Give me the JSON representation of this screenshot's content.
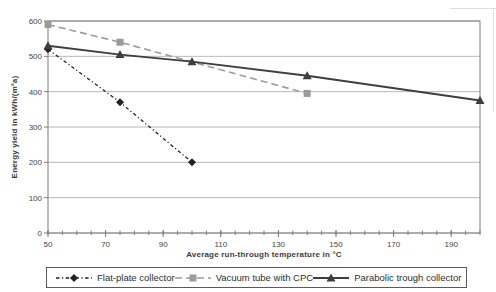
{
  "chart_data": {
    "type": "line",
    "title": "",
    "xlabel": "Average run-through temperature in °C",
    "ylabel": "Energy yield in kWh/(m²a)",
    "xlim": [
      50,
      200
    ],
    "ylim": [
      0,
      600
    ],
    "xticks": [
      50,
      70,
      90,
      110,
      130,
      150,
      170,
      190
    ],
    "x_minor_tick_step": 5,
    "yticks": [
      0,
      100,
      200,
      300,
      400,
      500,
      600
    ],
    "grid": "horizontal",
    "legend_position": "bottom",
    "series": [
      {
        "name": "Flat-plate collector",
        "marker": "diamond",
        "line_style": "dash-dot",
        "color": "#222222",
        "dash": "3.5 2.5 1.2 2.5",
        "width": 1.3,
        "x": [
          50,
          75,
          100
        ],
        "y": [
          520,
          370,
          200
        ]
      },
      {
        "name": "Vacuum tube with CPC",
        "marker": "square",
        "line_style": "dashed",
        "color": "#9b9b9b",
        "dash": "7 4",
        "width": 1.6,
        "x": [
          50,
          75,
          140
        ],
        "y": [
          590,
          540,
          395
        ]
      },
      {
        "name": "Parabolic trough collector",
        "marker": "triangle",
        "line_style": "solid",
        "color": "#3e3e3e",
        "dash": "",
        "width": 1.8,
        "x": [
          50,
          75,
          100,
          140,
          200
        ],
        "y": [
          530,
          505,
          485,
          445,
          375
        ]
      }
    ],
    "style": {
      "grid_color": "#b8b8b8",
      "axis_color": "#7d7d7d",
      "text_color": "#454545",
      "background": "#ffffff"
    }
  }
}
